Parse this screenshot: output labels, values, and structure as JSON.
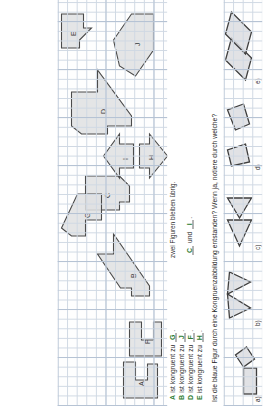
{
  "worksheet": {
    "language": "de",
    "question": "Ist die blaue Figur durch eine Kongruenzabbildung entstanden? Wenn ja, notiere durch welche?",
    "remaining_note": "zwei Figuren bleiben übrig.",
    "congruent_phrase": "ist kongruent zu"
  },
  "answers": [
    {
      "left": "A",
      "phrase": "ist kongruent zu",
      "right": "G"
    },
    {
      "left": "B",
      "phrase": "ist kongruent zu",
      "right": "J"
    },
    {
      "left": "D",
      "phrase": "ist kongruent zu",
      "right": "F"
    },
    {
      "left": "E",
      "phrase": "ist kongruent zu",
      "right": "H"
    }
  ],
  "leftover": {
    "first": "C",
    "conjunction": "und",
    "second": "I"
  },
  "figure_labels": [
    "A",
    "B",
    "C",
    "D",
    "E",
    "F",
    "G",
    "H",
    "I",
    "J"
  ],
  "sub_tasks": [
    {
      "key": "a)"
    },
    {
      "key": "b)"
    },
    {
      "key": "c)"
    },
    {
      "key": "d)"
    },
    {
      "key": "e)"
    }
  ],
  "colors": {
    "grid_line": "#cfd8e3",
    "grid_major": "#b6c3d4",
    "shape_fill": "#dfe0e2",
    "shape_stroke": "#4b4b4b",
    "answer_ink": "#2f7d32",
    "paper": "#fefefe"
  }
}
